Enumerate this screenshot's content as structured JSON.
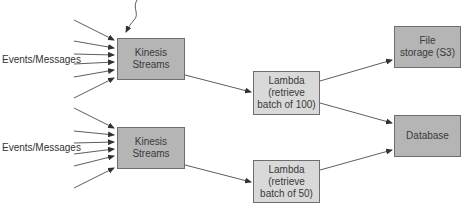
{
  "diagram": {
    "sources": [
      {
        "label": "Events/Messages"
      },
      {
        "label": "Events/Messages"
      }
    ],
    "nodes": {
      "kinesis1": {
        "label": "Kinesis\nStreams"
      },
      "kinesis2": {
        "label": "Kinesis\nStreams"
      },
      "lambda1": {
        "label": "Lambda\n(retrieve\nbatch of 100)"
      },
      "lambda2": {
        "label": "Lambda\n(retrieve\nbatch of 50)"
      },
      "s3": {
        "label": "File\nstorage (S3)"
      },
      "database": {
        "label": "Database"
      }
    },
    "edges": [
      {
        "from": "Events/Messages",
        "to": "Kinesis Streams (1)",
        "count": 7
      },
      {
        "from": "Events/Messages",
        "to": "Kinesis Streams (2)",
        "count": 7
      },
      {
        "from": "Kinesis Streams (1)",
        "to": "Lambda (retrieve batch of 100)"
      },
      {
        "from": "Kinesis Streams (2)",
        "to": "Lambda (retrieve batch of 50)"
      },
      {
        "from": "Lambda (retrieve batch of 100)",
        "to": "File storage (S3)"
      },
      {
        "from": "Lambda (retrieve batch of 100)",
        "to": "Database"
      },
      {
        "from": "Lambda (retrieve batch of 50)",
        "to": "Database"
      }
    ],
    "colors": {
      "stream_fill": "#b5b5b5",
      "lambda_fill": "#d9d9d9",
      "storage_fill": "#b5b5b5",
      "border": "#6e6e6e",
      "arrow": "#333333"
    }
  }
}
